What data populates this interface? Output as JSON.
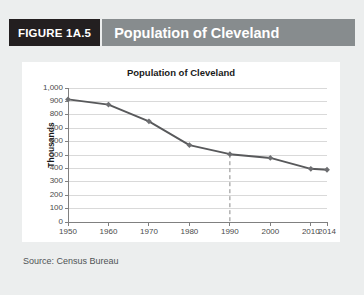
{
  "figure": {
    "number_label": "FIGURE 1A.5",
    "title": "Population of Cleveland",
    "source": "Source: Census Bureau"
  },
  "colors": {
    "figure_number_bg": "#231f20",
    "figure_title_bg": "#878c8e",
    "panel_bg": "#eceeee",
    "card_bg": "#ffffff",
    "line": "#58595b",
    "marker": "#6d6e71",
    "gridline": "#d9d9d9",
    "axis": "#808080",
    "dashed_guide": "#8a8a8a"
  },
  "chart_data": {
    "type": "line",
    "title": "Population of Cleveland",
    "xlabel": "",
    "ylabel": "Thousands",
    "x": [
      1950,
      1960,
      1970,
      1980,
      1990,
      2000,
      2010,
      2014
    ],
    "xtick_labels": [
      "1950",
      "1960",
      "1970",
      "1980",
      "1990",
      "2000",
      "2010",
      "2014"
    ],
    "values": [
      915,
      876,
      751,
      574,
      506,
      478,
      397,
      390
    ],
    "ylim": [
      0,
      1000
    ],
    "ytick_labels": [
      "0",
      "100",
      "200",
      "300",
      "400",
      "500",
      "600",
      "700",
      "800",
      "900",
      "1,000"
    ],
    "ytick_values": [
      0,
      100,
      200,
      300,
      400,
      500,
      600,
      700,
      800,
      900,
      1000
    ],
    "grid": true,
    "legend": false,
    "annotations": [
      {
        "type": "dashed-vertical-line",
        "at_x": 1990,
        "from_y": 506,
        "to_y": 0
      }
    ]
  }
}
